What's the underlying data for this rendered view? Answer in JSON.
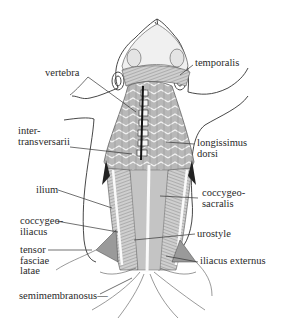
{
  "figure": {
    "line_color": "#333333",
    "muscle_fill": "#bdbdbd",
    "bone_fill": "#f2f2f2"
  },
  "labels": {
    "vertebra": {
      "lines": [
        "vertebra"
      ]
    },
    "temporalis": {
      "lines": [
        "temporalis"
      ]
    },
    "intertransversarii": {
      "lines": [
        "inter-",
        "transversarii"
      ]
    },
    "longissimus_dorsi": {
      "lines": [
        "longissimus",
        "dorsi"
      ]
    },
    "ilium": {
      "lines": [
        "ilium"
      ]
    },
    "coccygeosacralis": {
      "lines": [
        "coccygeo-",
        "sacralis"
      ]
    },
    "coccygeoiliacus": {
      "lines": [
        "coccygeo-",
        "iliacus"
      ]
    },
    "urostyle": {
      "lines": [
        "urostyle"
      ]
    },
    "tensor_fasciae_latae": {
      "lines": [
        "tensor",
        "fasciae",
        "latae"
      ]
    },
    "iliacus_externus": {
      "lines": [
        "iliacus externus"
      ]
    },
    "semimembranosus": {
      "lines": [
        "semimembranosus—"
      ]
    }
  }
}
